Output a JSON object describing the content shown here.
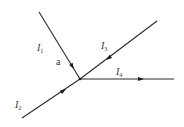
{
  "diagram": {
    "title": "",
    "junction": {
      "label": "a",
      "x": 80,
      "y": 79
    },
    "currents": [
      {
        "id": "l1",
        "symbol": "I",
        "subscript": "1",
        "from": [
          39,
          12
        ],
        "to": [
          80,
          79
        ],
        "direction": "into-junction",
        "label_pos": [
          37,
          51
        ]
      },
      {
        "id": "l2",
        "symbol": "I",
        "subscript": "2",
        "from": [
          22,
          118
        ],
        "to": [
          80,
          79
        ],
        "direction": "into-junction",
        "label_pos": [
          15,
          108
        ]
      },
      {
        "id": "l3",
        "symbol": "I",
        "subscript": "3",
        "from": [
          157,
          21
        ],
        "to": [
          80,
          79
        ],
        "direction": "into-junction",
        "label_pos": [
          101,
          49
        ]
      },
      {
        "id": "l4",
        "symbol": "I",
        "subscript": "4",
        "from": [
          80,
          79
        ],
        "to": [
          174,
          79
        ],
        "direction": "out-of-junction",
        "label_pos": [
          116,
          75
        ]
      }
    ],
    "colors": {
      "line": "#2a2a2a",
      "text": "#333333",
      "background": "#ffffff"
    }
  }
}
